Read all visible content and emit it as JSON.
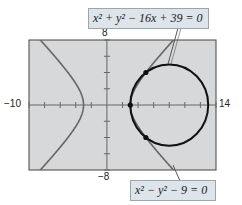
{
  "chart_data": {
    "type": "line",
    "title": "",
    "xlabel": "",
    "ylabel": "",
    "xlim": [
      -10,
      14
    ],
    "ylim": [
      -8,
      8
    ],
    "tick_labels": {
      "x_min": "−10",
      "x_max": "14",
      "y_max": "8",
      "y_min": "−8"
    },
    "x_tick_step": 2,
    "y_tick_step": 2,
    "grid": false,
    "series": [
      {
        "name": "circle",
        "equation": "x² + y² − 16x + 39 = 0",
        "shape": "circle",
        "center": [
          8,
          0
        ],
        "radius": 5,
        "color": "#111111"
      },
      {
        "name": "hyperbola",
        "equation": "x² − y² − 9 = 0",
        "shape": "hyperbola",
        "a": 3,
        "color": "#666666"
      }
    ],
    "intersection_points": [
      [
        3,
        0
      ],
      [
        5,
        4
      ],
      [
        5,
        -4
      ]
    ],
    "annotations": [
      {
        "text": "x² + y² − 16x + 39 = 0",
        "points_to": "circle"
      },
      {
        "text": "x² − y² − 9 = 0",
        "points_to": "hyperbola"
      }
    ]
  },
  "labels": {
    "x_min": "−10",
    "x_max": "14",
    "y_max": "8",
    "y_min": "−8",
    "eq_circle": "x² + y² − 16x + 39 = 0",
    "eq_hyperbola": "x² − y² − 9 = 0"
  }
}
